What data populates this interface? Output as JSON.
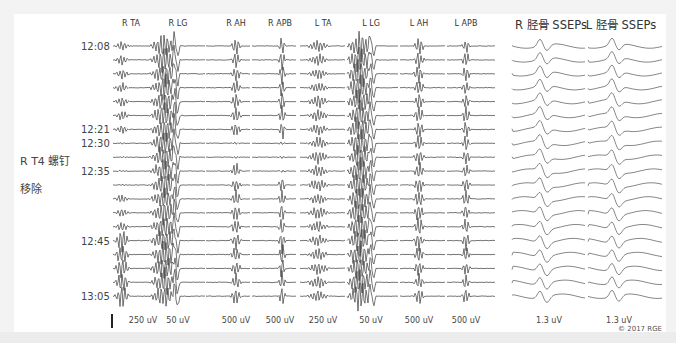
{
  "figure": {
    "emg_columns": [
      {
        "label": "R TA",
        "x": 131,
        "scale": "250 uV"
      },
      {
        "label": "R LG",
        "x": 178,
        "scale": "50 uV"
      },
      {
        "label": "R AH",
        "x": 236,
        "scale": "500 uV"
      },
      {
        "label": "R APB",
        "x": 280,
        "scale": "500 uV"
      },
      {
        "label": "L TA",
        "x": 323,
        "scale": "250 uV"
      },
      {
        "label": "L LG",
        "x": 371,
        "scale": "50 uV"
      },
      {
        "label": "L AH",
        "x": 419,
        "scale": "500 uV"
      },
      {
        "label": "L APB",
        "x": 466,
        "scale": "500 uV"
      }
    ],
    "ssep_columns": [
      {
        "label": "R 胫骨 SSEPs",
        "x": 551,
        "scale": "1.3 uV"
      },
      {
        "label": "L 胫骨 SSEPs",
        "x": 621,
        "scale": "1.3 uV"
      }
    ],
    "time_labels": [
      {
        "text": "12:08",
        "row": 0
      },
      {
        "text": "12:21",
        "row": 6
      },
      {
        "text": "12:30",
        "row": 7
      },
      {
        "text": "12:35",
        "row": 9
      },
      {
        "text": "12:45",
        "row": 14
      },
      {
        "text": "13:05",
        "row": 18
      }
    ],
    "annotation": {
      "line1": "R T4 螺钉",
      "line2": "移除"
    },
    "row_count": 19,
    "row_top": 46,
    "row_spacing": 13.9,
    "copyright": "© 2017 RGE",
    "trace_color": "#3a3a3a",
    "ssep_color": "#6a6a6a"
  },
  "chart_data": {
    "type": "line",
    "series_columns": [
      "R TA",
      "R LG",
      "R AH",
      "R APB",
      "L TA",
      "L LG",
      "L AH",
      "L APB",
      "R 胫骨 SSEPs",
      "L 胫骨 SSEPs"
    ],
    "scales": [
      "250 uV",
      "50 uV",
      "500 uV",
      "500 uV",
      "250 uV",
      "50 uV",
      "500 uV",
      "500 uV",
      "1.3 uV",
      "1.3 uV"
    ],
    "time_ticks": [
      "12:08",
      "12:21",
      "12:30",
      "12:35",
      "12:45",
      "13:05"
    ],
    "rows": 19,
    "event_annotation": "R T4 螺钉 移除 (between 12:21 and 12:35)",
    "observation": "R TA, R AH and R APB responses drop out at 12:30–12:35 and recover by 12:45–13:05; SSEPs remain stable"
  }
}
